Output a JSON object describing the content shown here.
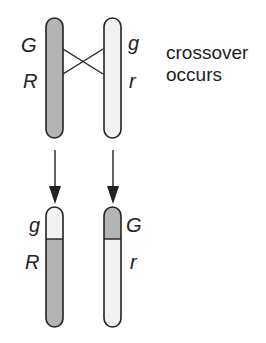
{
  "colors": {
    "shaded": "#b4b4b4",
    "light": "#f2f2f2",
    "stroke": "#222222"
  },
  "top": {
    "left_chromosome": {
      "label_upper": "G",
      "label_lower": "R"
    },
    "right_chromosome": {
      "label_upper": "g",
      "label_lower": "r"
    },
    "annotation": {
      "line1": "crossover",
      "line2": "occurs"
    }
  },
  "bottom": {
    "left_chromosome": {
      "label_upper": "g",
      "label_lower": "R"
    },
    "right_chromosome": {
      "label_upper": "G",
      "label_lower": "r"
    }
  }
}
